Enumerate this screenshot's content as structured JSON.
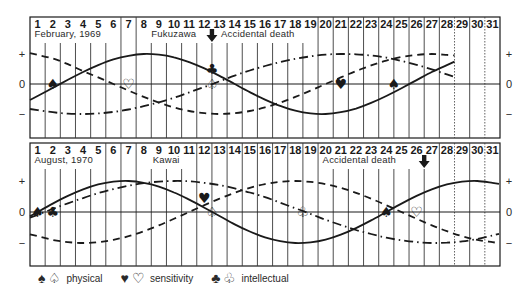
{
  "chart_data": [
    {
      "type": "line",
      "title": "February, 1969",
      "subject": "Fukuzawa",
      "annotation": "Accidental death",
      "event_day": 12,
      "x": [
        1,
        2,
        3,
        4,
        5,
        6,
        7,
        8,
        9,
        10,
        11,
        12,
        13,
        14,
        15,
        16,
        17,
        18,
        19,
        20,
        21,
        22,
        23,
        24,
        25,
        26,
        27,
        28
      ],
      "day_labels": [
        "1",
        "2",
        "3",
        "4",
        "5",
        "6",
        "7",
        "8",
        "9",
        "10",
        "11",
        "12",
        "13",
        "14",
        "15",
        "16",
        "17",
        "18",
        "19",
        "20",
        "21",
        "22",
        "23",
        "24",
        "25",
        "26",
        "27",
        "28",
        "29",
        "30",
        "31"
      ],
      "days_in_month": 28,
      "ylim": [
        -1,
        1
      ],
      "yticks": [
        "+",
        "0",
        "−"
      ],
      "series": [
        {
          "name": "physical",
          "period": 23,
          "line": "solid",
          "values": [
            -0.4,
            -0.13,
            0.14,
            0.4,
            0.63,
            0.82,
            0.94,
            1.0,
            0.98,
            0.89,
            0.73,
            0.52,
            0.27,
            0.0,
            -0.27,
            -0.52,
            -0.73,
            -0.89,
            -0.98,
            -1.0,
            -0.94,
            -0.82,
            -0.63,
            -0.4,
            -0.14,
            0.13,
            0.4,
            0.63
          ],
          "zero_crossings": [
            {
              "day": 2,
              "marker": "spade-filled"
            },
            {
              "day": 12.5,
              "marker": "spade-outline"
            },
            {
              "day": 24.5,
              "marker": "spade-filled"
            }
          ]
        },
        {
          "name": "sensitivity",
          "period": 28,
          "line": "dashed",
          "values": [
            0.97,
            0.85,
            0.66,
            0.43,
            0.22,
            0.0,
            -0.22,
            -0.43,
            -0.62,
            -0.78,
            -0.9,
            -0.97,
            -1.0,
            -0.97,
            -0.9,
            -0.78,
            -0.62,
            -0.43,
            -0.22,
            0.0,
            0.22,
            0.43,
            0.62,
            0.78,
            0.9,
            0.97,
            1.0,
            0.97
          ],
          "zero_crossings": [
            {
              "day": 7,
              "marker": "heart-outline"
            },
            {
              "day": 21,
              "marker": "heart-filled"
            }
          ]
        },
        {
          "name": "intellectual",
          "period": 33,
          "line": "dash-dot",
          "values": [
            -0.87,
            -0.94,
            -0.99,
            -1.0,
            -0.98,
            -0.93,
            -0.85,
            -0.74,
            -0.61,
            -0.46,
            -0.28,
            -0.1,
            0.09,
            0.28,
            0.45,
            0.6,
            0.73,
            0.84,
            0.92,
            0.98,
            1.0,
            0.99,
            0.95,
            0.88,
            0.77,
            0.64,
            0.49,
            0.32
          ],
          "zero_crossings": [
            {
              "day": 12.5,
              "marker": "club-filled"
            }
          ]
        }
      ]
    },
    {
      "type": "line",
      "title": "August, 1970",
      "subject": "Kawai",
      "annotation": "Accidental death",
      "event_day": 26,
      "x": [
        1,
        2,
        3,
        4,
        5,
        6,
        7,
        8,
        9,
        10,
        11,
        12,
        13,
        14,
        15,
        16,
        17,
        18,
        19,
        20,
        21,
        22,
        23,
        24,
        25,
        26,
        27,
        28,
        29,
        30,
        31
      ],
      "day_labels": [
        "1",
        "2",
        "3",
        "4",
        "5",
        "6",
        "7",
        "8",
        "9",
        "10",
        "11",
        "12",
        "13",
        "14",
        "15",
        "16",
        "17",
        "18",
        "19",
        "20",
        "21",
        "22",
        "23",
        "24",
        "25",
        "26",
        "27",
        "28",
        "29",
        "30",
        "31"
      ],
      "days_in_month": 31,
      "ylim": [
        -1,
        1
      ],
      "yticks": [
        "+",
        "0",
        "−"
      ],
      "series": [
        {
          "name": "physical",
          "period": 23,
          "line": "solid",
          "values": [
            0.0,
            0.27,
            0.52,
            0.73,
            0.89,
            0.98,
            1.0,
            0.94,
            0.82,
            0.63,
            0.4,
            0.14,
            -0.13,
            -0.4,
            -0.63,
            -0.82,
            -0.94,
            -1.0,
            -0.98,
            -0.89,
            -0.73,
            -0.52,
            -0.27,
            0.0,
            0.27,
            0.52,
            0.73,
            0.89,
            0.98,
            1.0,
            0.94
          ],
          "zero_crossings": [
            {
              "day": 1,
              "marker": "spade-filled"
            },
            {
              "day": 12.5,
              "marker": "spade-outline"
            },
            {
              "day": 24,
              "marker": "spade-filled"
            }
          ]
        },
        {
          "name": "sensitivity",
          "period": 28,
          "line": "dashed",
          "values": [
            -0.78,
            -0.9,
            -0.97,
            -1.0,
            -0.97,
            -0.9,
            -0.78,
            -0.62,
            -0.43,
            -0.22,
            0.0,
            0.22,
            0.43,
            0.62,
            0.78,
            0.9,
            0.97,
            1.0,
            0.97,
            0.9,
            0.78,
            0.62,
            0.43,
            0.22,
            0.0,
            -0.22,
            -0.43,
            -0.62,
            -0.78,
            -0.9,
            -0.97
          ],
          "zero_crossings": [
            {
              "day": 12,
              "marker": "heart-filled"
            },
            {
              "day": 26,
              "marker": "heart-outline"
            }
          ]
        },
        {
          "name": "intellectual",
          "period": 33,
          "line": "dash-dot",
          "values": [
            -0.09,
            0.1,
            0.28,
            0.45,
            0.61,
            0.74,
            0.85,
            0.93,
            0.98,
            1.0,
            0.99,
            0.94,
            0.87,
            0.76,
            0.63,
            0.48,
            0.3,
            0.12,
            -0.06,
            -0.25,
            -0.42,
            -0.58,
            -0.71,
            -0.83,
            -0.91,
            -0.97,
            -1.0,
            -0.99,
            -0.95,
            -0.87,
            -0.76
          ],
          "zero_crossings": [
            {
              "day": 2,
              "marker": "club-filled"
            },
            {
              "day": 18.5,
              "marker": "club-outline"
            }
          ]
        }
      ]
    }
  ],
  "charts": [
    {
      "month_label": "February, 1969",
      "person": "Fukuzawa",
      "event": "Accidental death"
    },
    {
      "month_label": "August, 1970",
      "person": "Kawai",
      "event": "Accidental death"
    }
  ],
  "axis": {
    "plus": "+",
    "zero": "0",
    "minus": "−"
  },
  "legend": {
    "physical": {
      "label": "physical",
      "filled": "♠",
      "outline": "♤"
    },
    "sensitivity": {
      "label": "sensitivity",
      "filled": "♥",
      "outline": "♡"
    },
    "intellectual": {
      "label": "intellectual",
      "filled": "♣",
      "outline": "♧"
    }
  },
  "colors": {
    "ink": "#1a1a1a",
    "grid": "#3a3a3a",
    "background": "#ffffff"
  }
}
